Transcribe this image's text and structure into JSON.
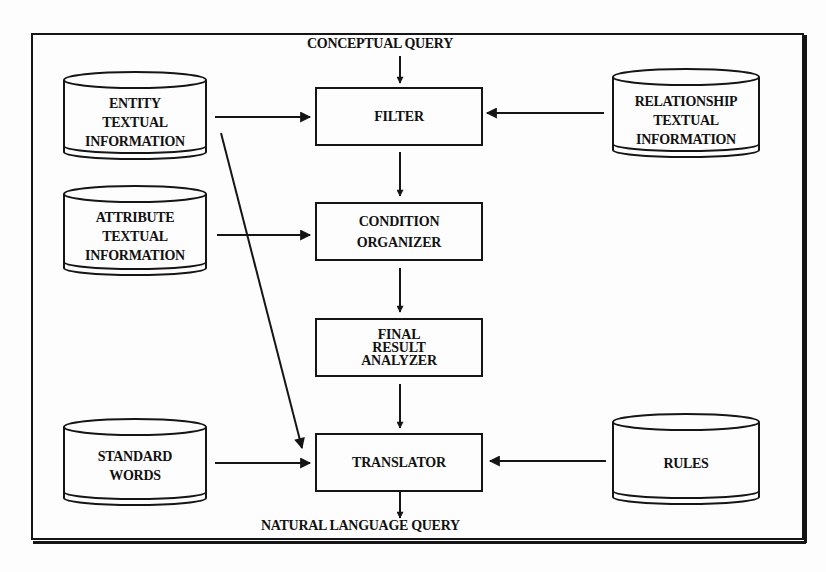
{
  "diagram": {
    "input_label": "CONCEPTUAL QUERY",
    "output_label": "NATURAL LANGUAGE QUERY",
    "processes": [
      {
        "id": "filter",
        "lines": [
          "FILTER"
        ]
      },
      {
        "id": "condition_organizer",
        "lines": [
          "CONDITION",
          "ORGANIZER"
        ]
      },
      {
        "id": "final_result_analyzer",
        "lines": [
          "FINAL",
          "RESULT",
          "ANALYZER"
        ]
      },
      {
        "id": "translator",
        "lines": [
          "TRANSLATOR"
        ]
      }
    ],
    "data_stores": [
      {
        "id": "entity_textual_information",
        "lines": [
          "ENTITY",
          "TEXTUAL",
          "INFORMATION"
        ]
      },
      {
        "id": "relationship_textual_information",
        "lines": [
          "RELATIONSHIP",
          "TEXTUAL",
          "INFORMATION"
        ]
      },
      {
        "id": "attribute_textual_information",
        "lines": [
          "ATTRIBUTE",
          "TEXTUAL",
          "INFORMATION"
        ]
      },
      {
        "id": "standard_words",
        "lines": [
          "STANDARD",
          "WORDS"
        ]
      },
      {
        "id": "rules",
        "lines": [
          "RULES"
        ]
      }
    ],
    "edges": [
      {
        "from": "CONCEPTUAL QUERY",
        "to": "FILTER"
      },
      {
        "from": "ENTITY TEXTUAL INFORMATION",
        "to": "FILTER"
      },
      {
        "from": "RELATIONSHIP TEXTUAL INFORMATION",
        "to": "FILTER"
      },
      {
        "from": "FILTER",
        "to": "CONDITION ORGANIZER"
      },
      {
        "from": "ATTRIBUTE TEXTUAL INFORMATION",
        "to": "CONDITION ORGANIZER"
      },
      {
        "from": "CONDITION ORGANIZER",
        "to": "FINAL RESULT ANALYZER"
      },
      {
        "from": "FINAL RESULT ANALYZER",
        "to": "TRANSLATOR"
      },
      {
        "from": "ENTITY TEXTUAL INFORMATION",
        "to": "TRANSLATOR"
      },
      {
        "from": "STANDARD WORDS",
        "to": "TRANSLATOR"
      },
      {
        "from": "RULES",
        "to": "TRANSLATOR"
      },
      {
        "from": "TRANSLATOR",
        "to": "NATURAL LANGUAGE QUERY"
      }
    ],
    "colors": {
      "ink": "#151515",
      "paper": "#fdfdfd"
    }
  }
}
